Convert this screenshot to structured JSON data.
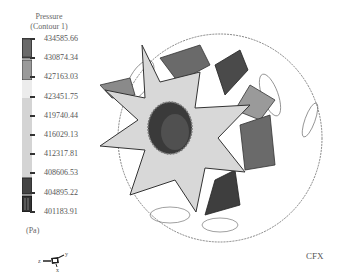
{
  "legend": {
    "title_line1": "Pressure",
    "title_line2": "(Contour 1)",
    "unit": "(Pa)",
    "labels": [
      "434585.66",
      "430874.34",
      "427163.03",
      "423451.75",
      "419740.44",
      "416029.13",
      "412317.81",
      "408606.53",
      "404895.22",
      "401183.91"
    ],
    "colors": [
      "#505050",
      "#8a8a8a",
      "#c8c8c8",
      "#e8e8e8",
      "#d6d6d6",
      "#d0d0d0",
      "#cfcfcf",
      "#cccccc",
      "#3f3f3f",
      "#2e2e2e"
    ]
  },
  "axis_triad": {
    "x": "x",
    "y": "y",
    "z": "z"
  },
  "brand": "CFX",
  "scene": {
    "object": "impeller",
    "blade_count": 8
  }
}
